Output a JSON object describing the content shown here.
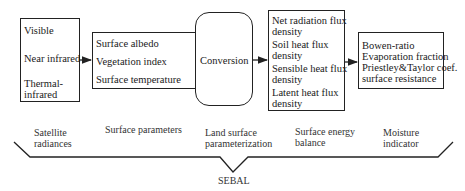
{
  "boxes": [
    {
      "id": "satellite",
      "items": [
        "Visible",
        "Near infrared",
        "Thermal-",
        "infrared"
      ]
    },
    {
      "id": "surface-params",
      "items": [
        "Surface albedo",
        "Vegetation index",
        "Surface temperature"
      ]
    },
    {
      "id": "conversion",
      "items": [
        "Conversion"
      ]
    },
    {
      "id": "energy",
      "items": [
        "Net radiation flux",
        "density",
        "Soil heat flux",
        "density",
        "Sensible heat flux",
        "density",
        "Latent heat flux",
        "density"
      ]
    },
    {
      "id": "moisture",
      "items": [
        "Bowen-ratio",
        "Evaporation fraction",
        "Priestley&Taylor coef.",
        "surface resistance"
      ]
    }
  ],
  "stage_labels": [
    [
      "Satellite",
      "radiances"
    ],
    [
      "Surface parameters"
    ],
    [
      "Land surface",
      "parameterization"
    ],
    [
      "Surface energy",
      "balance"
    ],
    [
      "Moisture",
      "indicator"
    ]
  ],
  "brace_label": "SEBAL",
  "colors": {
    "line": "#222222",
    "text": "#1a1a1a"
  }
}
